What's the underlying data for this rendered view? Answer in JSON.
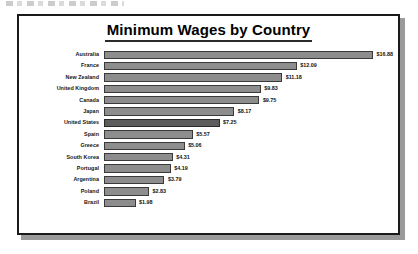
{
  "page": {
    "scan_artifact_name": "scan-edge-artifact"
  },
  "chart": {
    "title": "Minimum Wages by Country",
    "frame_color": "#1a1a1a",
    "bar_color": "#8d8d8d",
    "bar_highlight_color": "#5d5d5d",
    "bar_border_color": "#3a3a3a"
  },
  "chart_data": {
    "type": "bar",
    "orientation": "horizontal",
    "title": "Minimum Wages by Country",
    "xlabel": "",
    "ylabel": "",
    "grid": false,
    "legend": null,
    "xlim": [
      0,
      16.88
    ],
    "value_prefix": "$",
    "categories": [
      "Australia",
      "France",
      "New Zealand",
      "United Kingdom",
      "Canada",
      "Japan",
      "United States",
      "Spain",
      "Greece",
      "South Korea",
      "Portugal",
      "Argentina",
      "Poland",
      "Brazil"
    ],
    "values": [
      16.88,
      12.09,
      11.18,
      9.83,
      9.75,
      8.17,
      7.25,
      5.57,
      5.06,
      4.31,
      4.19,
      3.79,
      2.83,
      1.98
    ],
    "value_labels": [
      "$16.88",
      "$12.09",
      "$11.18",
      "$9.83",
      "$9.75",
      "$8.17",
      "$7.25",
      "$5.57",
      "$5.06",
      "$4.31",
      "$4.19",
      "$3.79",
      "$2.83",
      "$1.98"
    ],
    "highlighted": [
      "United States"
    ]
  }
}
